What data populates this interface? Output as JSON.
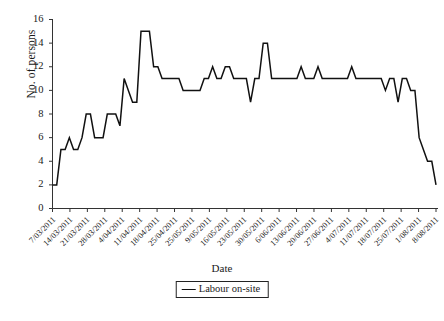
{
  "chart_data": {
    "type": "line",
    "title": "",
    "xlabel": "Date",
    "ylabel": "No. of persons",
    "ylim": [
      0,
      16
    ],
    "ytick_step": 2,
    "grid": false,
    "legend_position": "bottom",
    "line_color": "#111111",
    "series": [
      {
        "name": "Labour on-site",
        "values": [
          2,
          2,
          5,
          5,
          6,
          5,
          5,
          6,
          8,
          8,
          6,
          6,
          6,
          8,
          8,
          8,
          7,
          11,
          10,
          9,
          9,
          15,
          15,
          15,
          12,
          12,
          11,
          11,
          11,
          11,
          11,
          10,
          10,
          10,
          10,
          10,
          11,
          11,
          12,
          11,
          11,
          12,
          12,
          11,
          11,
          11,
          11,
          9,
          11,
          11,
          14,
          14,
          11,
          11,
          11,
          11,
          11,
          11,
          11,
          12,
          11,
          11,
          11,
          12,
          11,
          11,
          11,
          11,
          11,
          11,
          11,
          12,
          11,
          11,
          11,
          11,
          11,
          11,
          11,
          10,
          11,
          11,
          9,
          11,
          11,
          10,
          10,
          6,
          5,
          4,
          4,
          2
        ]
      }
    ],
    "ytick_labels": [
      "0",
      "2",
      "4",
      "6",
      "8",
      "10",
      "12",
      "14",
      "16"
    ],
    "xtick_labels": [
      "7/03/2011",
      "14/03/2011",
      "21/03/2011",
      "28/03/2011",
      "4/04/2011",
      "11/04/2011",
      "18/04/2011",
      "25/04/2011",
      "25/05/2011",
      "9/05/2011",
      "16/05/2011",
      "23/05/2011",
      "30/05/2011",
      "6/06/2011",
      "13/06/2011",
      "20/06/2011",
      "27/06/2011",
      "4/07/2011",
      "11/07/2011",
      "18/07/2011",
      "25/07/2011",
      "1/08/2011",
      "8/08/2011"
    ]
  },
  "legend": {
    "label": "Labour on-site"
  },
  "caption": {
    "text": ""
  }
}
